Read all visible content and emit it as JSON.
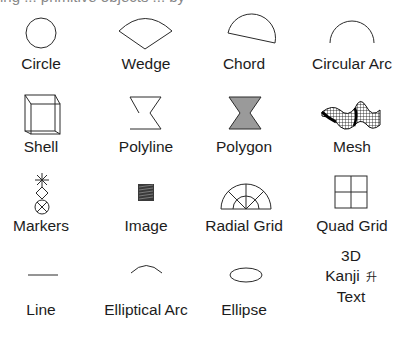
{
  "header": {
    "clipped_text": "ing ... primitive objects ... by"
  },
  "grid": {
    "columns": 4,
    "rows": 4,
    "items": [
      {
        "label": "Circle",
        "icon": "circle-icon"
      },
      {
        "label": "Wedge",
        "icon": "wedge-icon"
      },
      {
        "label": "Chord",
        "icon": "chord-icon"
      },
      {
        "label": "Circular Arc",
        "icon": "circular-arc-icon"
      },
      {
        "label": "Shell",
        "icon": "shell-cube-icon"
      },
      {
        "label": "Polyline",
        "icon": "polyline-icon"
      },
      {
        "label": "Polygon",
        "icon": "polygon-icon"
      },
      {
        "label": "Mesh",
        "icon": "mesh-surface-icon"
      },
      {
        "label": "Markers",
        "icon": "markers-icon"
      },
      {
        "label": "Image",
        "icon": "image-icon"
      },
      {
        "label": "Radial Grid",
        "icon": "radial-grid-icon"
      },
      {
        "label": "Quad Grid",
        "icon": "quad-grid-icon"
      },
      {
        "label": "Line",
        "icon": "line-icon"
      },
      {
        "label": "Elliptical Arc",
        "icon": "elliptical-arc-icon"
      },
      {
        "label": "Ellipse",
        "icon": "ellipse-icon"
      },
      {
        "label_lines": [
          "3D",
          "Kanji",
          "Text"
        ],
        "kanji_glyph": "升",
        "icon": "text-3d-icon"
      }
    ]
  },
  "colors": {
    "stroke": "#2a2a2a",
    "polygon_fill": "#9a9a9a",
    "text": "#1c1c1c",
    "background": "#ffffff"
  }
}
